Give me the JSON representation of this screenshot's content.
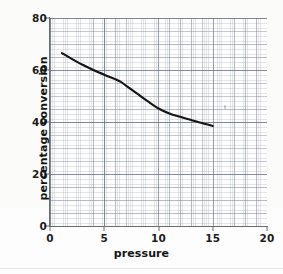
{
  "chart_data": {
    "type": "line",
    "title": "",
    "xlabel": "pressure",
    "ylabel": "percentage conversion",
    "xlim": [
      0,
      20
    ],
    "ylim": [
      0,
      80
    ],
    "xticks": [
      0,
      5,
      10,
      15,
      20
    ],
    "yticks": [
      0,
      20,
      40,
      60,
      80
    ],
    "xtick_labels": [
      "0",
      "5",
      "10",
      "15",
      "20"
    ],
    "ytick_labels": [
      "0",
      "20",
      "40",
      "60",
      "80"
    ],
    "grid": true,
    "grid_style": "graph-paper-minor-and-major",
    "legend": null,
    "series": [
      {
        "name": "percentage conversion",
        "color": "#141414",
        "x": [
          1.1,
          2,
          3,
          4,
          5,
          6,
          6.5,
          7,
          8,
          9,
          10,
          11,
          12,
          13,
          14,
          15
        ],
        "y": [
          66.5,
          64.3,
          62.0,
          60.0,
          58.2,
          56.5,
          55.5,
          54.0,
          51.0,
          48.0,
          45.2,
          43.3,
          42.0,
          40.8,
          39.6,
          38.5
        ]
      }
    ],
    "annotations": [
      {
        "name": "scan-speck",
        "x": 16.1,
        "y": 46.5,
        "text": ""
      }
    ]
  },
  "axes": {
    "y_labels": [
      {
        "value": 80,
        "text": "80"
      },
      {
        "value": 60,
        "text": "60"
      },
      {
        "value": 40,
        "text": "40"
      },
      {
        "value": 20,
        "text": "20"
      },
      {
        "value": 0,
        "text": "0"
      }
    ],
    "x_labels": [
      {
        "value": 0,
        "text": "0"
      },
      {
        "value": 5,
        "text": "5"
      },
      {
        "value": 10,
        "text": "10"
      },
      {
        "value": 15,
        "text": "15"
      },
      {
        "value": 20,
        "text": "20"
      }
    ],
    "y_title": "percentage conversion",
    "x_title": "pressure"
  },
  "colors": {
    "curve": "#141414",
    "axis": "#6b6b6b",
    "grid_minor": "#96a0af",
    "grid_major": "#7884962",
    "background": "#fdfdfd",
    "text": "#141414"
  }
}
